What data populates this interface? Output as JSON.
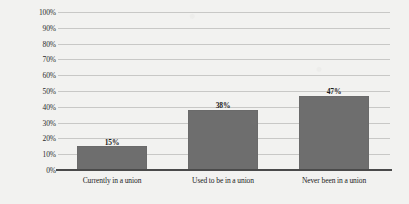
{
  "chart_data": {
    "type": "bar",
    "title": "",
    "xlabel": "",
    "ylabel": "",
    "categories": [
      "Currently in a union",
      "Used to be in a union",
      "Never been in a union"
    ],
    "values": [
      15,
      38,
      47
    ],
    "value_labels": [
      "15%",
      "38%",
      "47%"
    ],
    "ylim": [
      0,
      100
    ],
    "ytick_labels": [
      "100%",
      "90%",
      "80%",
      "70%",
      "60%",
      "50%",
      "40%",
      "30%",
      "20%",
      "10%",
      "0%"
    ],
    "ytick_values": [
      100,
      90,
      80,
      70,
      60,
      50,
      40,
      30,
      20,
      10,
      0
    ],
    "grid": "horizontal",
    "legend": "none",
    "colors": {
      "bar_fill": "#6e6e6e",
      "gridline": "#c8c8c6",
      "axis_line": "#4a4a4a",
      "text": "#1c1c1c",
      "background": "#f2f2f0"
    }
  }
}
